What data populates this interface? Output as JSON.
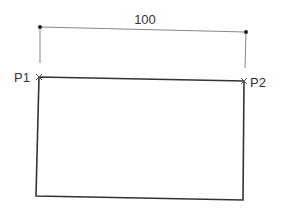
{
  "diagram": {
    "type": "dimensioned-rectangle",
    "dimension": {
      "label": "100",
      "start_point": [
        40,
        27
      ],
      "end_point": [
        246,
        32
      ]
    },
    "points": [
      {
        "label": "P1",
        "position": [
          39,
          77
        ],
        "marker": "cross"
      },
      {
        "label": "P2",
        "position": [
          244,
          81
        ],
        "marker": "cross"
      }
    ],
    "rectangle": {
      "corners": [
        [
          39,
          77
        ],
        [
          244,
          81
        ],
        [
          243,
          200
        ],
        [
          36,
          196
        ]
      ]
    },
    "colors": {
      "stroke": "#333333",
      "extension_line": "#888888",
      "background": "#ffffff"
    }
  }
}
